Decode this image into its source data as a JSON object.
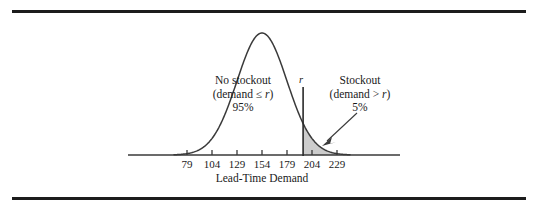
{
  "figure": {
    "name": "lead-time-demand-normal-distribution",
    "background_color": "#ffffff",
    "rule_color": "#1c1c1c",
    "curve_color": "#3a3a3a",
    "axis_color": "#3a3a3a",
    "shade_color": "#cccccc",
    "text_color": "#1a1a1a"
  },
  "axis": {
    "title": "Lead-Time Demand",
    "tick_labels": [
      "79",
      "104",
      "129",
      "154",
      "179",
      "204",
      "229"
    ]
  },
  "annotations": {
    "reorder_point_label": "r",
    "left_region": {
      "title": "No stockout",
      "condition_prefix": "(demand ≤ ",
      "condition_var": "r",
      "condition_suffix": ")",
      "percent": "95%"
    },
    "right_region": {
      "title": "Stockout",
      "condition_prefix": "(demand > ",
      "condition_var": "r",
      "condition_suffix": ")",
      "percent": "5%"
    }
  },
  "chart_data": {
    "type": "line",
    "title": "",
    "subtitle": "",
    "xlabel": "Lead-Time Demand",
    "ylabel": "",
    "grid": false,
    "legend_position": "none",
    "distribution": "normal",
    "mean": 154,
    "std_dev": 25,
    "x_tick_values": [
      79,
      104,
      129,
      154,
      179,
      204,
      229
    ],
    "xlim": [
      60,
      250
    ],
    "ylim": [
      0,
      1.05
    ],
    "reorder_point_r": 195.1,
    "regions": [
      {
        "name": "No stockout",
        "condition": "demand ≤ r",
        "probability_percent": 95,
        "shaded": false,
        "x_range": [
          60,
          195.1
        ]
      },
      {
        "name": "Stockout",
        "condition": "demand > r",
        "probability_percent": 5,
        "shaded": true,
        "shade_color": "#cccccc",
        "x_range": [
          195.1,
          250
        ]
      }
    ],
    "x": [
      60,
      70,
      79,
      90,
      104,
      116,
      129,
      141,
      154,
      166,
      179,
      191,
      195.1,
      204,
      216,
      229,
      240,
      250
    ],
    "y": [
      0.0003,
      0.0015,
      0.0074,
      0.0273,
      0.1353,
      0.3189,
      0.6065,
      0.8681,
      1.0,
      0.8681,
      0.6065,
      0.3487,
      0.2725,
      0.1353,
      0.0773,
      0.0273,
      0.007,
      0.0015
    ]
  }
}
